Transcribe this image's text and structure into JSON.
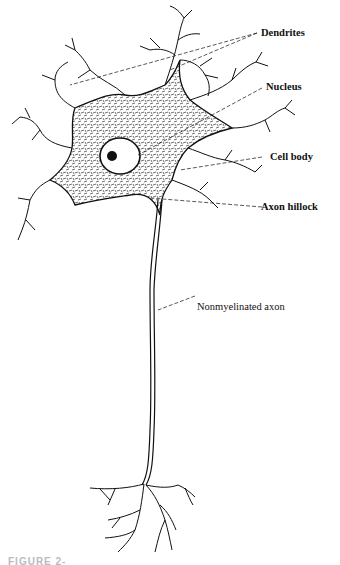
{
  "figure": {
    "labels": {
      "dendrites": "Dendrites",
      "nucleus": "Nucleus",
      "cell_body": "Cell body",
      "axon_hillock": "Axon hillock",
      "axon": "Nonmyelinated axon"
    },
    "caption": "FIGURE 2-"
  },
  "colors": {
    "ink": "#111111",
    "background": "#ffffff"
  }
}
